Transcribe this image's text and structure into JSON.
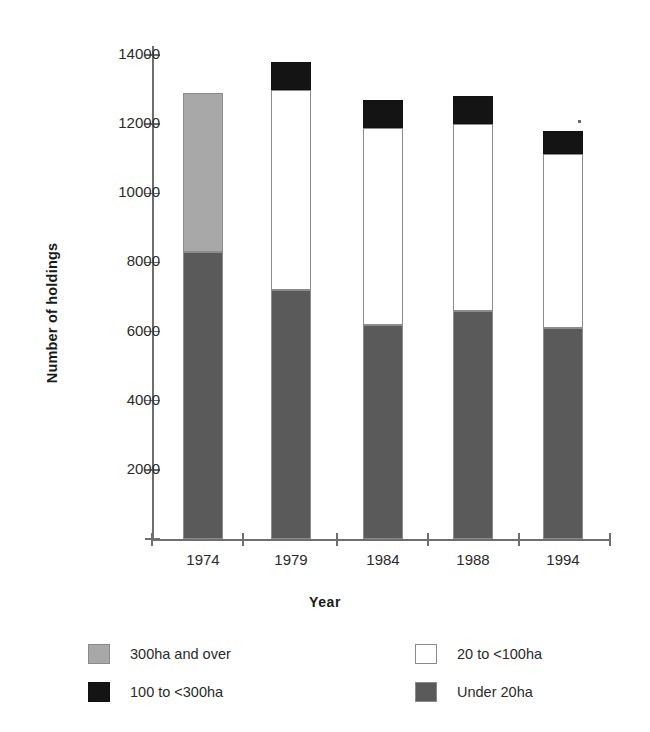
{
  "chart_data": {
    "type": "bar",
    "subtype": "stacked",
    "title": "",
    "xlabel": "Year",
    "ylabel": "Number of holdings",
    "categories": [
      "1974",
      "1979",
      "1984",
      "1988",
      "1994"
    ],
    "ylim": [
      0,
      14000
    ],
    "yticks": [
      0,
      2000,
      4000,
      6000,
      8000,
      10000,
      12000,
      14000
    ],
    "ytick_labels": [
      "",
      "2000",
      "4000",
      "6000",
      "8000",
      "10000",
      "12000",
      "14000"
    ],
    "grid": false,
    "legend_position": "below-plot",
    "series": [
      {
        "name": "Under 20ha",
        "color": "#5a5a5a",
        "values": [
          8300,
          7200,
          6200,
          6600,
          6100
        ]
      },
      {
        "name": "20 to <100ha",
        "color": "#ffffff",
        "values": [
          0,
          5800,
          5700,
          5400,
          5050
        ]
      },
      {
        "name": "100 to <300ha",
        "color": "#141414",
        "values": [
          0,
          800,
          800,
          800,
          650
        ]
      },
      {
        "name": "300ha and over",
        "color": "#a8a8a8",
        "values": [
          4600,
          0,
          0,
          0,
          0
        ]
      }
    ],
    "totals": [
      12900,
      13800,
      12700,
      12800,
      11800
    ],
    "annotations": [
      {
        "name": "speck",
        "x": 1994,
        "y": 12000
      }
    ]
  },
  "axes": {
    "ylabel": "Number of holdings",
    "xlabel": "Year",
    "ytick_labels": [
      "2000",
      "4000",
      "6000",
      "8000",
      "10000",
      "12000",
      "14000"
    ],
    "xtick_labels": [
      "1974",
      "1979",
      "1984",
      "1988",
      "1994"
    ]
  },
  "legend": {
    "items": [
      {
        "label": "300ha and over",
        "color": "#a8a8a8"
      },
      {
        "label": "100 to <300ha",
        "color": "#141414"
      },
      {
        "label": "20 to <100ha",
        "color": "#ffffff"
      },
      {
        "label": "Under 20ha",
        "color": "#5a5a5a"
      }
    ]
  },
  "colors": {
    "under20": "#5a5a5a",
    "mid20to100": "#ffffff",
    "mid100to300": "#141414",
    "over300": "#a8a8a8",
    "axis": "#6e6e6e",
    "text": "#2b2b2b",
    "background": "#ffffff"
  }
}
